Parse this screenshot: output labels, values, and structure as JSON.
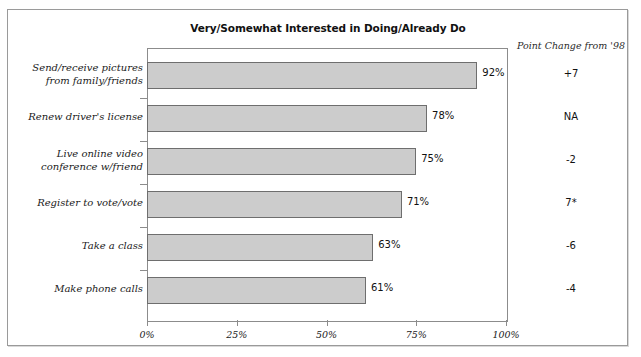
{
  "chart_data": {
    "type": "bar",
    "orientation": "horizontal",
    "title": "Very/Somewhat Interested in Doing/Already Do",
    "xlabel": "",
    "ylabel": "",
    "xlim": [
      0,
      100
    ],
    "grid": false,
    "legend": null,
    "categories": [
      "Send/receive pictures from family/friends",
      "Renew driver's license",
      "Live online video conference w/friend",
      "Register to vote/vote",
      "Take a class",
      "Make phone calls"
    ],
    "values": [
      92,
      78,
      75,
      71,
      63,
      61
    ],
    "value_labels": [
      "92%",
      "78%",
      "75%",
      "71%",
      "63%",
      "61%"
    ],
    "xticks": [
      0,
      25,
      50,
      75,
      100
    ],
    "xtick_labels": [
      "0%",
      "25%",
      "50%",
      "75%",
      "100%"
    ],
    "annotations": {
      "column_header": "Point Change from '98",
      "column_values": [
        "+7",
        "NA",
        "-2",
        "7*",
        "-6",
        "-4"
      ]
    },
    "colors": {
      "bar_fill": "#cccccc",
      "bar_border": "#6e6e6e",
      "axis": "#8c8c8c",
      "frame": "#9a9a9a",
      "text": "#111111"
    }
  },
  "chart": {
    "title": "Very/Somewhat Interested in Doing/Already Do",
    "point_change_header": "Point Change from '98",
    "rows": [
      {
        "label_line1": "Send/receive pictures",
        "label_line2": "from family/friends",
        "value": 92,
        "value_label": "92%",
        "point_change": "+7"
      },
      {
        "label_line1": "Renew driver's license",
        "label_line2": "",
        "value": 78,
        "value_label": "78%",
        "point_change": "NA"
      },
      {
        "label_line1": "Live online video",
        "label_line2": "conference w/friend",
        "value": 75,
        "value_label": "75%",
        "point_change": "-2"
      },
      {
        "label_line1": "Register to vote/vote",
        "label_line2": "",
        "value": 71,
        "value_label": "71%",
        "point_change": "7*"
      },
      {
        "label_line1": "Take a class",
        "label_line2": "",
        "value": 63,
        "value_label": "63%",
        "point_change": "-6"
      },
      {
        "label_line1": "Make phone calls",
        "label_line2": "",
        "value": 61,
        "value_label": "61%",
        "point_change": "-4"
      }
    ],
    "xtick_labels": [
      "0%",
      "25%",
      "50%",
      "75%",
      "100%"
    ]
  }
}
